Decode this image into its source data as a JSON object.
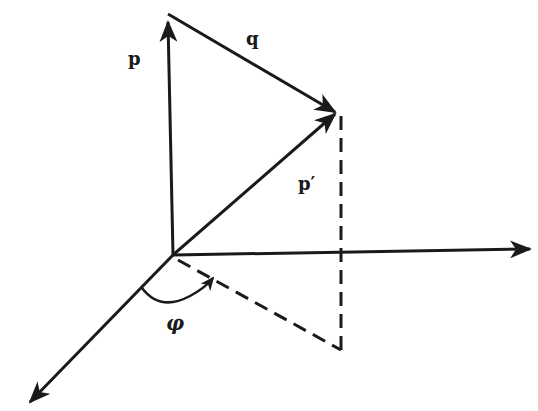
{
  "diagram": {
    "type": "3d-vector-decomposition",
    "labels": {
      "p": "p",
      "q": "q",
      "p_prime": "p′",
      "phi": "φ"
    },
    "colors": {
      "ink": "#1a1a1a",
      "background": "#ffffff"
    },
    "points": {
      "origin": [
        173,
        255
      ],
      "p_tip": [
        166,
        40
      ],
      "p_prime_tip": [
        335,
        113
      ],
      "x_axis_end": [
        530,
        249
      ],
      "diag_axis_end": [
        30,
        402
      ],
      "projection_foot": [
        341,
        350
      ]
    }
  }
}
